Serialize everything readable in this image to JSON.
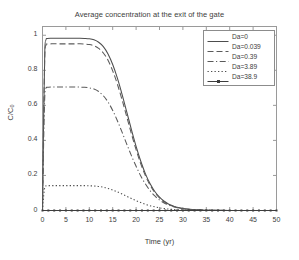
{
  "chart_data": {
    "type": "line",
    "title": "Average concentration at the exit of the gate",
    "xlabel": "Time (yr)",
    "ylabel": "C/C0",
    "xlim": [
      0,
      50
    ],
    "ylim": [
      0,
      1.05
    ],
    "xticks": [
      0,
      5,
      10,
      15,
      20,
      25,
      30,
      35,
      40,
      45,
      50
    ],
    "yticks": [
      0,
      0.2,
      0.4,
      0.6,
      0.8,
      1
    ],
    "xtick_labels": [
      "0",
      "5",
      "10",
      "15",
      "20",
      "25",
      "30",
      "35",
      "40",
      "45",
      "50"
    ],
    "ytick_labels": [
      "0",
      "0.2",
      "0.4",
      "0.6",
      "0.8",
      "1"
    ],
    "grid": false,
    "legend_position": "top-right",
    "x": [
      0,
      0.25,
      0.5,
      0.75,
      1,
      2,
      3,
      4,
      5,
      6,
      7,
      8,
      9,
      10,
      11,
      12,
      13,
      14,
      15,
      16,
      17,
      18,
      19,
      20,
      21,
      22,
      23,
      24,
      25,
      26,
      27,
      28,
      29,
      30,
      32,
      34,
      36,
      38,
      40,
      42,
      44,
      46,
      48,
      50
    ],
    "series": [
      {
        "name": "Da=0",
        "style": "solid",
        "color": "#4d4d4d",
        "marker": "none",
        "values": [
          0,
          0.55,
          0.92,
          0.975,
          0.982,
          0.983,
          0.983,
          0.983,
          0.983,
          0.983,
          0.983,
          0.983,
          0.982,
          0.98,
          0.974,
          0.96,
          0.935,
          0.893,
          0.833,
          0.755,
          0.663,
          0.563,
          0.462,
          0.366,
          0.281,
          0.209,
          0.152,
          0.108,
          0.076,
          0.053,
          0.036,
          0.025,
          0.017,
          0.012,
          0.006,
          0.003,
          0.0015,
          0.0008,
          0.0004,
          0.0002,
          0.0001,
          0.0001,
          0,
          0
        ]
      },
      {
        "name": "Da=0.039",
        "style": "dashed",
        "color": "#5a5a5a",
        "marker": "none",
        "values": [
          0,
          0.52,
          0.89,
          0.944,
          0.95,
          0.951,
          0.951,
          0.951,
          0.951,
          0.951,
          0.951,
          0.951,
          0.95,
          0.947,
          0.94,
          0.925,
          0.899,
          0.857,
          0.797,
          0.721,
          0.632,
          0.535,
          0.438,
          0.347,
          0.266,
          0.198,
          0.144,
          0.102,
          0.072,
          0.05,
          0.034,
          0.023,
          0.016,
          0.011,
          0.005,
          0.0025,
          0.0012,
          0.0006,
          0.0003,
          0.0002,
          0.0001,
          0,
          0,
          0
        ]
      },
      {
        "name": "Da=0.39",
        "style": "dashdot",
        "color": "#5a5a5a",
        "marker": "none",
        "values": [
          0,
          0.4,
          0.66,
          0.698,
          0.703,
          0.705,
          0.705,
          0.705,
          0.705,
          0.705,
          0.705,
          0.704,
          0.703,
          0.7,
          0.693,
          0.679,
          0.655,
          0.619,
          0.571,
          0.512,
          0.447,
          0.379,
          0.313,
          0.252,
          0.197,
          0.151,
          0.113,
          0.083,
          0.06,
          0.043,
          0.03,
          0.021,
          0.015,
          0.01,
          0.005,
          0.0025,
          0.0012,
          0.0006,
          0.0003,
          0.0002,
          0.0001,
          0,
          0,
          0
        ]
      },
      {
        "name": "Da=3.89",
        "style": "dotted",
        "color": "#4d4d4d",
        "marker": "none",
        "values": [
          0,
          0.085,
          0.133,
          0.14,
          0.141,
          0.142,
          0.142,
          0.142,
          0.142,
          0.142,
          0.142,
          0.142,
          0.142,
          0.141,
          0.14,
          0.137,
          0.133,
          0.126,
          0.117,
          0.106,
          0.094,
          0.081,
          0.068,
          0.056,
          0.045,
          0.035,
          0.027,
          0.021,
          0.015,
          0.011,
          0.008,
          0.006,
          0.004,
          0.003,
          0.0015,
          0.0008,
          0.0004,
          0.0002,
          0.0001,
          0.0001,
          0,
          0,
          0,
          0
        ]
      },
      {
        "name": "Da=38.9",
        "style": "solid-marker",
        "color": "#3d3d3d",
        "marker": "dot",
        "values": [
          0,
          0,
          0,
          0,
          0,
          0,
          0,
          0,
          0,
          0,
          0,
          0,
          0,
          0,
          0,
          0,
          0,
          0,
          0,
          0,
          0,
          0,
          0,
          0,
          0,
          0,
          0,
          0,
          0,
          0,
          0,
          0,
          0,
          0,
          0,
          0,
          0,
          0,
          0,
          0,
          0,
          0,
          0,
          0
        ]
      }
    ]
  },
  "legend": {
    "entries": [
      {
        "label": "Da=0"
      },
      {
        "label": "Da=0.039"
      },
      {
        "label": "Da=0.39"
      },
      {
        "label": "Da=3.89"
      },
      {
        "label": "Da=38.9"
      }
    ]
  },
  "axis_label_parts": {
    "y_main": "C/C",
    "y_sub": "0"
  }
}
